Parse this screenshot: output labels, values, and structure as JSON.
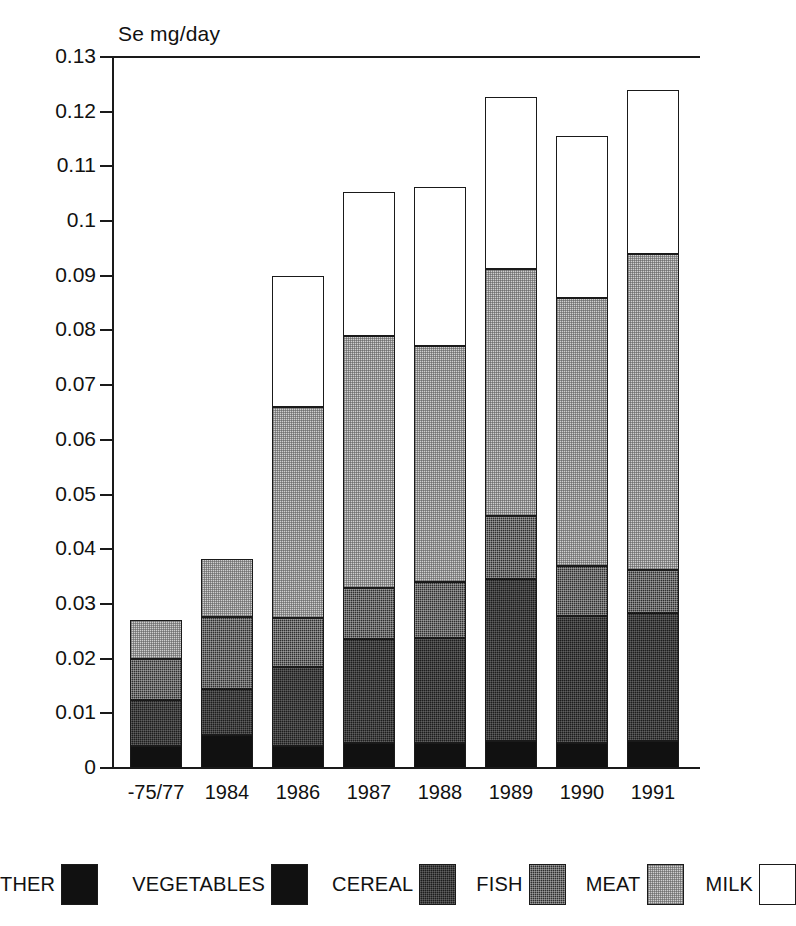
{
  "chart_data": {
    "type": "bar",
    "subtype": "stacked-bar",
    "title": "Se mg/day",
    "xlabel": "",
    "ylabel": "Se mg/day",
    "ylim": [
      0,
      0.13
    ],
    "grid": false,
    "legend_position": "bottom",
    "y_ticks": [
      "0.13",
      "0.12",
      "0.11",
      "0.1",
      "0.09",
      "0.08",
      "0.07",
      "0.06",
      "0.05",
      "0.04",
      "0.03",
      "0.02",
      "0.01",
      "0"
    ],
    "y_tick_values": [
      0.13,
      0.12,
      0.11,
      0.1,
      0.09,
      0.08,
      0.07,
      0.06,
      0.05,
      0.04,
      0.03,
      0.02,
      0.01,
      0
    ],
    "categories": [
      "-75/77",
      "1984",
      "1986",
      "1987",
      "1988",
      "1989",
      "1990",
      "1991"
    ],
    "series": [
      {
        "name": "OTHER",
        "values": [
          0.0,
          0.0,
          0.0,
          0.0,
          0.0,
          0.0,
          0.0,
          0.0
        ]
      },
      {
        "name": "VEGETABLES",
        "values": [
          0.004,
          0.006,
          0.004,
          0.0045,
          0.0045,
          0.005,
          0.0045,
          0.005
        ]
      },
      {
        "name": "CEREAL",
        "values": [
          0.0085,
          0.0085,
          0.0145,
          0.019,
          0.0192,
          0.0295,
          0.0233,
          0.0233
        ]
      },
      {
        "name": "FISH",
        "values": [
          0.0075,
          0.0132,
          0.009,
          0.0095,
          0.0103,
          0.0115,
          0.0092,
          0.0079
        ]
      },
      {
        "name": "MEAT",
        "values": [
          0.007,
          0.0132,
          0.0385,
          0.046,
          0.0432,
          0.0452,
          0.049,
          0.0578
        ]
      },
      {
        "name": "MILK",
        "values": [
          0.006,
          0.0106,
          0.024,
          0.0263,
          0.029,
          0.0315,
          0.0295,
          0.03
        ]
      }
    ],
    "totals": [
      0.026,
      0.0383,
      0.09,
      0.1053,
      0.1062,
      0.1227,
      0.1155,
      0.124
    ],
    "cumulative_tops": [
      {
        "category": "-75/77",
        "vegetables": 0.004,
        "cereal": 0.0125,
        "fish": 0.02,
        "meat": 0.027,
        "milk": 0.026
      },
      {
        "category": "1984",
        "vegetables": 0.006,
        "cereal": 0.0145,
        "fish": 0.0277,
        "meat": 0.0383,
        "milk": 0.0383
      },
      {
        "category": "1986",
        "vegetables": 0.004,
        "cereal": 0.0185,
        "fish": 0.0275,
        "meat": 0.066,
        "milk": 0.09
      },
      {
        "category": "1987",
        "vegetables": 0.0045,
        "cereal": 0.0235,
        "fish": 0.033,
        "meat": 0.079,
        "milk": 0.1053
      },
      {
        "category": "1988",
        "vegetables": 0.0045,
        "cereal": 0.0237,
        "fish": 0.034,
        "meat": 0.0772,
        "milk": 0.1062
      },
      {
        "category": "1989",
        "vegetables": 0.005,
        "cereal": 0.0345,
        "fish": 0.046,
        "meat": 0.0912,
        "milk": 0.1227
      },
      {
        "category": "1990",
        "vegetables": 0.0045,
        "cereal": 0.0278,
        "fish": 0.037,
        "meat": 0.086,
        "milk": 0.1155
      },
      {
        "category": "1991",
        "vegetables": 0.005,
        "cereal": 0.0283,
        "fish": 0.0362,
        "meat": 0.094,
        "milk": 0.124
      }
    ]
  },
  "legend": {
    "items": [
      {
        "label": "THER",
        "swatch": "solid-black"
      },
      {
        "label": "VEGETABLES",
        "swatch": "solid-black"
      },
      {
        "label": "CEREAL",
        "swatch": "dark-halftone"
      },
      {
        "label": "FISH",
        "swatch": "mid-dark-halftone"
      },
      {
        "label": "MEAT",
        "swatch": "light-halftone"
      },
      {
        "label": "MILK",
        "swatch": "white"
      }
    ]
  },
  "colors": {
    "axis": "#1a1a1a",
    "other": "#111111",
    "vegetables": "#111111",
    "cereal": "#1d1d1d",
    "fish": "#2f2f2f",
    "meat": "#cfcfcf",
    "milk": "#ededed",
    "background": "#ffffff"
  }
}
